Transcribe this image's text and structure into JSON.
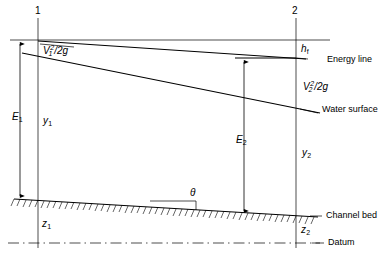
{
  "diagram": {
    "sections": {
      "upstream_label": "1",
      "downstream_label": "2"
    },
    "labels": {
      "velocity_head_1": {
        "symbol": "V",
        "sub": "1",
        "sup": "2",
        "denominator": "/2g",
        "text": "V₁²/2g"
      },
      "velocity_head_2": {
        "symbol": "V",
        "sub": "2",
        "sup": "2",
        "denominator": "/2g",
        "text": "V₂²/2g"
      },
      "head_loss": {
        "symbol": "h",
        "sub": "f",
        "text": "h_f"
      },
      "energy_line": "Energy line",
      "water_surface": "Water surface",
      "channel_bed": "Channel bed",
      "datum": "Datum",
      "theta": "θ",
      "specific_energy_1": {
        "symbol": "E",
        "sub": "1",
        "text": "E₁"
      },
      "specific_energy_2": {
        "symbol": "E",
        "sub": "2",
        "text": "E₂"
      },
      "depth_1": {
        "symbol": "y",
        "sub": "1",
        "text": "y₁"
      },
      "depth_2": {
        "symbol": "y",
        "sub": "2",
        "text": "y₂"
      },
      "elevation_1": {
        "symbol": "z",
        "sub": "1",
        "text": "z₁"
      },
      "elevation_2": {
        "symbol": "z",
        "sub": "2",
        "text": "z₂"
      }
    },
    "colors": {
      "line": "#000000",
      "background": "#ffffff",
      "hatch": "#000000"
    }
  }
}
